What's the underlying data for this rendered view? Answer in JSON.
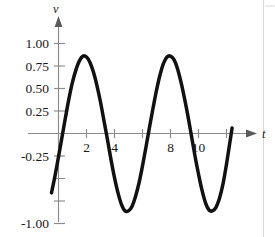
{
  "chart_data": {
    "type": "line",
    "title": "",
    "subtitle": "",
    "xlabel": "t",
    "ylabel": "v",
    "xlim": [
      -1.0,
      13.0
    ],
    "ylim": [
      -1.12,
      1.12
    ],
    "grid": false,
    "legend": null,
    "legend_position": "none",
    "x_ticks": [
      2,
      4,
      6,
      8,
      10,
      12
    ],
    "x_tick_labels": [
      "2",
      "4",
      "",
      "8",
      "10",
      ""
    ],
    "y_ticks": [
      1.0,
      0.75,
      0.5,
      0.25,
      -0.25,
      -0.5,
      -0.75,
      -1.0
    ],
    "y_tick_labels": [
      "1.00",
      "0.75",
      "0.50",
      "0.25",
      "-0.25",
      "",
      "",
      "-1.00"
    ],
    "annotations": [],
    "series": [
      {
        "name": "v(t)",
        "color": "#111111",
        "amplitude": 0.86,
        "period": 6.4,
        "phase_t0": 0.52,
        "x": [
          -0.5,
          -0.25,
          0.0,
          0.25,
          0.5,
          0.75,
          1.0,
          1.25,
          1.5,
          1.75,
          2.0,
          2.25,
          2.5,
          2.75,
          3.0,
          3.25,
          3.5,
          3.75,
          4.0,
          4.25,
          4.5,
          4.75,
          5.0,
          5.25,
          5.5,
          5.75,
          6.0,
          6.25,
          6.5,
          6.75,
          7.0,
          7.25,
          7.5,
          7.75,
          8.0,
          8.25,
          8.5,
          8.75,
          9.0,
          9.25,
          9.5,
          9.75,
          10.0,
          10.25,
          10.5,
          10.75,
          11.0,
          11.25,
          11.5,
          11.75,
          12.0,
          12.25,
          12.4
        ],
        "y": [
          -0.66,
          -0.47,
          -0.26,
          -0.04,
          0.18,
          0.39,
          0.57,
          0.71,
          0.81,
          0.86,
          0.85,
          0.79,
          0.68,
          0.53,
          0.35,
          0.14,
          -0.07,
          -0.29,
          -0.49,
          -0.66,
          -0.79,
          -0.86,
          -0.86,
          -0.81,
          -0.7,
          -0.55,
          -0.36,
          -0.15,
          0.07,
          0.28,
          0.48,
          0.65,
          0.78,
          0.85,
          0.86,
          0.82,
          0.72,
          0.57,
          0.39,
          0.19,
          -0.03,
          -0.25,
          -0.45,
          -0.63,
          -0.77,
          -0.85,
          -0.86,
          -0.82,
          -0.72,
          -0.56,
          -0.34,
          -0.09,
          0.06
        ]
      }
    ],
    "features": {
      "peaks": [
        {
          "t": 1.75,
          "v": 0.86
        },
        {
          "t": 8.1,
          "v": 0.86
        }
      ],
      "troughs": [
        {
          "t": 4.85,
          "v": -0.86
        },
        {
          "t": 11.15,
          "v": -0.86
        }
      ],
      "zero_crossings_rising": [
        0.3,
        6.65
      ],
      "zero_crossings_falling": [
        3.45,
        9.8
      ],
      "start_point": {
        "t": -0.5,
        "v": -0.66
      },
      "end_point": {
        "t": 12.4,
        "v": 0.66
      }
    }
  }
}
